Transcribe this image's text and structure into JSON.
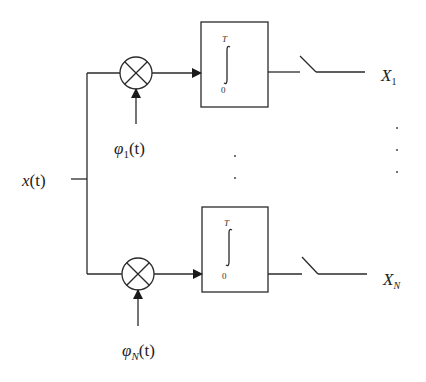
{
  "diagram": {
    "input": {
      "label": "x",
      "arg": "(t)"
    },
    "branches": [
      {
        "id": "1",
        "multiplier_symbol": "multiplier-icon",
        "basis": {
          "symbol": "φ",
          "subscript": "1",
          "arg": "(t)"
        },
        "integrator": {
          "upper_limit": "T",
          "lower_limit": "0"
        },
        "output": {
          "symbol": "X",
          "subscript": "1"
        }
      },
      {
        "id": "N",
        "multiplier_symbol": "multiplier-icon",
        "basis": {
          "symbol": "φ",
          "subscript": "N",
          "arg": "(t)"
        },
        "integrator": {
          "upper_limit": "T",
          "lower_limit": "0"
        },
        "output": {
          "symbol": "X",
          "subscript": "N"
        }
      }
    ],
    "ellipsis": "⋮",
    "colors": {
      "line": "#2a2a2a",
      "background": "#ffffff"
    }
  }
}
